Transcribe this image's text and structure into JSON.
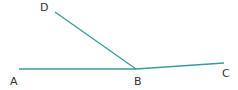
{
  "diagram": {
    "type": "geometry-angles",
    "line_color": "#3a9a9a",
    "points": {
      "A": {
        "label": "A",
        "x": 19,
        "y": 69,
        "lx": 10,
        "ly": 85
      },
      "B": {
        "label": "B",
        "x": 136,
        "y": 69,
        "lx": 134,
        "ly": 85
      },
      "C": {
        "label": "C",
        "x": 224,
        "y": 63,
        "lx": 222,
        "ly": 77
      },
      "D": {
        "label": "D",
        "x": 55,
        "y": 12,
        "lx": 40,
        "ly": 11
      }
    },
    "segments": [
      {
        "from": "A",
        "to": "B"
      },
      {
        "from": "B",
        "to": "C"
      },
      {
        "from": "B",
        "to": "D"
      }
    ]
  }
}
